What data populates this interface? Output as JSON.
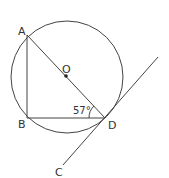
{
  "diagram": {
    "type": "geometry",
    "points": {
      "A": {
        "label": "A"
      },
      "B": {
        "label": "B"
      },
      "C": {
        "label": "C"
      },
      "D": {
        "label": "D"
      },
      "O": {
        "label": "O"
      }
    },
    "angle": {
      "label": "57°",
      "at": "D",
      "between": [
        "BD",
        "AD"
      ]
    },
    "colors": {
      "stroke": "#333333",
      "background": "#ffffff"
    }
  }
}
